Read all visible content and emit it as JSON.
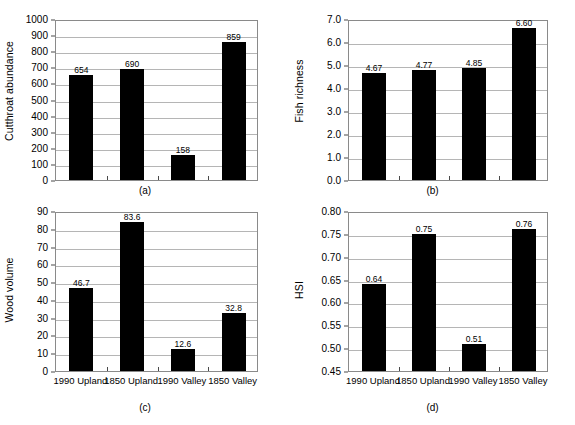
{
  "figure": {
    "categories": [
      "1990 Upland",
      "1850 Upland",
      "1990 Valley",
      "1850 Valley"
    ],
    "panels": [
      {
        "caption": "(a)",
        "ylabel": "Cutthroat abundance",
        "values": [
          654,
          690,
          158,
          859
        ],
        "labels": [
          "654",
          "690",
          "158",
          "859"
        ],
        "ticks": [
          "0",
          "100",
          "200",
          "300",
          "400",
          "500",
          "600",
          "700",
          "800",
          "900",
          "1000"
        ],
        "tickvals": [
          0,
          100,
          200,
          300,
          400,
          500,
          600,
          700,
          800,
          900,
          1000
        ],
        "ymin": 0,
        "ymax": 1000,
        "show_xlabels": false
      },
      {
        "caption": "(b)",
        "ylabel": "Fish richness",
        "values": [
          4.67,
          4.77,
          4.85,
          6.6
        ],
        "labels": [
          "4.67",
          "4.77",
          "4.85",
          "6.60"
        ],
        "ticks": [
          "0.0",
          "1.0",
          "2.0",
          "3.0",
          "4.0",
          "5.0",
          "6.0",
          "7.0"
        ],
        "tickvals": [
          0,
          1,
          2,
          3,
          4,
          5,
          6,
          7
        ],
        "ymin": 0,
        "ymax": 7,
        "show_xlabels": false
      },
      {
        "caption": "(c)",
        "ylabel": "Wood volume",
        "values": [
          46.7,
          83.6,
          12.6,
          32.8
        ],
        "labels": [
          "46.7",
          "83.6",
          "12.6",
          "32.8"
        ],
        "ticks": [
          "0",
          "10",
          "20",
          "30",
          "40",
          "50",
          "60",
          "70",
          "80",
          "90"
        ],
        "tickvals": [
          0,
          10,
          20,
          30,
          40,
          50,
          60,
          70,
          80,
          90
        ],
        "ymin": 0,
        "ymax": 90,
        "show_xlabels": true
      },
      {
        "caption": "(d)",
        "ylabel": "HSI",
        "values": [
          0.64,
          0.75,
          0.51,
          0.76
        ],
        "labels": [
          "0.64",
          "0.75",
          "0.51",
          "0.76"
        ],
        "ticks": [
          "0.45",
          "0.50",
          "0.55",
          "0.60",
          "0.65",
          "0.70",
          "0.75",
          "0.80"
        ],
        "tickvals": [
          0.45,
          0.5,
          0.55,
          0.6,
          0.65,
          0.7,
          0.75,
          0.8
        ],
        "ymin": 0.45,
        "ymax": 0.8,
        "show_xlabels": true
      }
    ]
  },
  "chart_data": [
    {
      "type": "bar",
      "title": "(a)",
      "categories": [
        "1990 Upland",
        "1850 Upland",
        "1990 Valley",
        "1850 Valley"
      ],
      "values": [
        654,
        690,
        158,
        859
      ],
      "data_labels": [
        "654",
        "690",
        "158",
        "859"
      ],
      "xlabel": "",
      "ylabel": "Cutthroat abundance",
      "ylim": [
        0,
        1000
      ],
      "ytick_labels": [
        "0",
        "100",
        "200",
        "300",
        "400",
        "500",
        "600",
        "700",
        "800",
        "900",
        "1000"
      ],
      "grid": true,
      "legend": "none",
      "bar_color": "#000000"
    },
    {
      "type": "bar",
      "title": "(b)",
      "categories": [
        "1990 Upland",
        "1850 Upland",
        "1990 Valley",
        "1850 Valley"
      ],
      "values": [
        4.67,
        4.77,
        4.85,
        6.6
      ],
      "data_labels": [
        "4.67",
        "4.77",
        "4.85",
        "6.60"
      ],
      "xlabel": "",
      "ylabel": "Fish richness",
      "ylim": [
        0,
        7
      ],
      "ytick_labels": [
        "0.0",
        "1.0",
        "2.0",
        "3.0",
        "4.0",
        "5.0",
        "6.0",
        "7.0"
      ],
      "grid": true,
      "legend": "none",
      "bar_color": "#000000"
    },
    {
      "type": "bar",
      "title": "(c)",
      "categories": [
        "1990 Upland",
        "1850 Upland",
        "1990 Valley",
        "1850 Valley"
      ],
      "values": [
        46.7,
        83.6,
        12.6,
        32.8
      ],
      "data_labels": [
        "46.7",
        "83.6",
        "12.6",
        "32.8"
      ],
      "xlabel": "",
      "ylabel": "Wood volume",
      "ylim": [
        0,
        90
      ],
      "ytick_labels": [
        "0",
        "10",
        "20",
        "30",
        "40",
        "50",
        "60",
        "70",
        "80",
        "90"
      ],
      "grid": true,
      "legend": "none",
      "bar_color": "#000000"
    },
    {
      "type": "bar",
      "title": "(d)",
      "categories": [
        "1990 Upland",
        "1850 Upland",
        "1990 Valley",
        "1850 Valley"
      ],
      "values": [
        0.64,
        0.75,
        0.51,
        0.76
      ],
      "data_labels": [
        "0.64",
        "0.75",
        "0.51",
        "0.76"
      ],
      "xlabel": "",
      "ylabel": "HSI",
      "ylim": [
        0.45,
        0.8
      ],
      "ytick_labels": [
        "0.45",
        "0.50",
        "0.55",
        "0.60",
        "0.65",
        "0.70",
        "0.75",
        "0.80"
      ],
      "grid": true,
      "legend": "none",
      "bar_color": "#000000"
    }
  ]
}
